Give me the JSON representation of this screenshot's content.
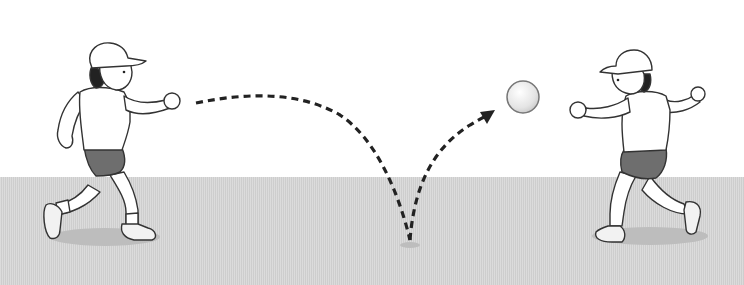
{
  "scene": {
    "description": "Two children playing catch with a bouncing ball",
    "colors": {
      "sky": "#ffffff",
      "ground": "#d4d4d4",
      "outline": "#333333",
      "shorts": "#6e6e6e",
      "hair": "#222222",
      "shadow": "#bdbdbd",
      "trajectory": "#222222",
      "ball": "#e6e6e6"
    },
    "elements": {
      "left_child": {
        "role": "thrower",
        "facing": "right"
      },
      "right_child": {
        "role": "catcher",
        "facing": "left"
      },
      "ball": {
        "position": "airborne, near right child"
      },
      "trajectory": {
        "style": "dashed arc",
        "bounce_point": "ground center",
        "arrow": "toward ball"
      }
    }
  }
}
